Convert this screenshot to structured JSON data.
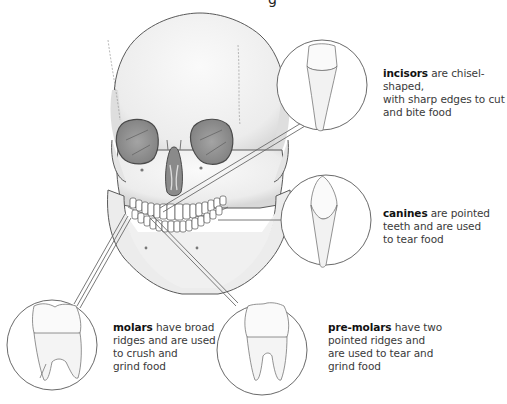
{
  "figure": {
    "title_fragment": "g",
    "colors": {
      "outline": "#5a5a5a",
      "bone": "#f2f2f2",
      "bone_shade": "#dcdcdc",
      "orbit": "#8a8a8a",
      "leader_line": "#6a6a6a",
      "text": "#3a3a3a",
      "bold_text": "#111111"
    }
  },
  "callouts": [
    {
      "id": "incisors",
      "term": "incisors",
      "description_lines": [
        "are chisel-shaped,",
        "with sharp edges to cut",
        "and bite food"
      ]
    },
    {
      "id": "canines",
      "term": "canines",
      "description_lines": [
        "are pointed",
        "teeth and are used",
        "to tear food"
      ]
    },
    {
      "id": "molars",
      "term": "molars",
      "description_lines": [
        "have broad",
        "ridges and are used",
        "to crush and",
        "grind food"
      ]
    },
    {
      "id": "pre-molars",
      "term": "pre-molars",
      "description_lines": [
        "have two",
        "pointed ridges and",
        "are used to tear and",
        "grind food"
      ]
    }
  ]
}
